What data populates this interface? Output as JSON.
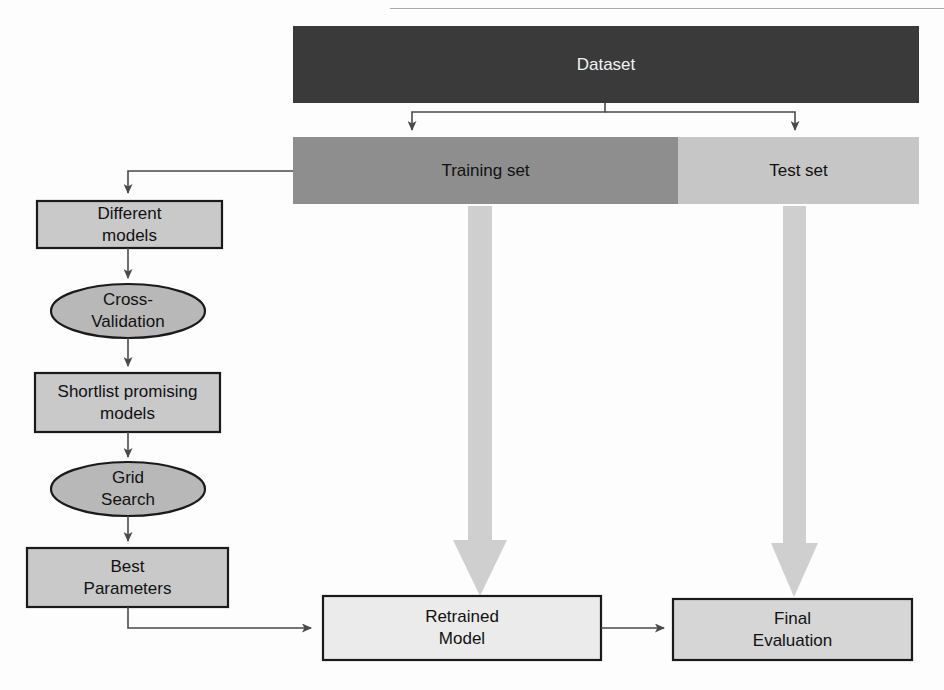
{
  "diagram": {
    "colors": {
      "dataset_fill": "#3a3a3a",
      "training_fill": "#8e8e8e",
      "test_fill": "#c6c6c6",
      "box_fill": "#c9c9c9",
      "ellipse_fill": "#b8b8b8",
      "retrained_fill": "#ebebeb",
      "final_fill": "#d6d6d6",
      "big_arrow_fill": "#cfcfcf",
      "stroke": "#1a1a1a",
      "connector": "#4a4a4a",
      "background": "#fdfdfd"
    },
    "nodes": {
      "dataset": {
        "label": "Dataset",
        "shape": "bar"
      },
      "training_set": {
        "label": "Training set",
        "shape": "bar"
      },
      "test_set": {
        "label": "Test set",
        "shape": "bar"
      },
      "different_models": {
        "label": "Different\nmodels",
        "shape": "rect"
      },
      "cross_validation": {
        "label": "Cross-\nValidation",
        "shape": "ellipse"
      },
      "shortlist_models": {
        "label": "Shortlist promising\nmodels",
        "shape": "rect"
      },
      "grid_search": {
        "label": "Grid\nSearch",
        "shape": "ellipse"
      },
      "best_parameters": {
        "label": "Best\nParameters",
        "shape": "rect"
      },
      "retrained_model": {
        "label": "Retrained\nModel",
        "shape": "rect"
      },
      "final_evaluation": {
        "label": "Final\nEvaluation",
        "shape": "rect"
      }
    },
    "edges": [
      {
        "name": "dataset-to-training-set",
        "from": "dataset",
        "to": "training_set",
        "style": "thin-arrow"
      },
      {
        "name": "dataset-to-test-set",
        "from": "dataset",
        "to": "test_set",
        "style": "thin-arrow"
      },
      {
        "name": "training-set-to-different-models",
        "from": "training_set",
        "to": "different_models",
        "style": "thin-arrow"
      },
      {
        "name": "different-models-to-cross-validation",
        "from": "different_models",
        "to": "cross_validation",
        "style": "thin-arrow"
      },
      {
        "name": "cross-validation-to-shortlist",
        "from": "cross_validation",
        "to": "shortlist_models",
        "style": "thin-arrow"
      },
      {
        "name": "shortlist-to-grid-search",
        "from": "shortlist_models",
        "to": "grid_search",
        "style": "thin-arrow"
      },
      {
        "name": "grid-search-to-best-parameters",
        "from": "grid_search",
        "to": "best_parameters",
        "style": "thin-arrow"
      },
      {
        "name": "best-parameters-to-retrained-model",
        "from": "best_parameters",
        "to": "retrained_model",
        "style": "thin-arrow"
      },
      {
        "name": "retrained-model-to-final-evaluation",
        "from": "retrained_model",
        "to": "final_evaluation",
        "style": "thin-arrow"
      },
      {
        "name": "training-set-to-retrained-model",
        "from": "training_set",
        "to": "retrained_model",
        "style": "block-arrow"
      },
      {
        "name": "test-set-to-final-evaluation",
        "from": "test_set",
        "to": "final_evaluation",
        "style": "block-arrow"
      }
    ]
  }
}
